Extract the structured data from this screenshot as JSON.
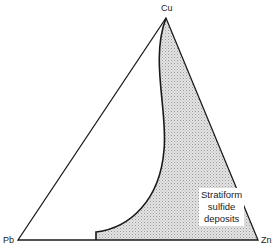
{
  "diagram": {
    "type": "ternary",
    "vertices": {
      "top": "Cu",
      "left": "Pb",
      "right": "Zn"
    },
    "region": {
      "label_lines": [
        "Stratiform",
        "sulfide",
        "deposits"
      ],
      "fill": "#d9d9d9",
      "pattern": "stipple"
    },
    "colors": {
      "line": "#1a1a1a",
      "background": "#ffffff"
    }
  }
}
